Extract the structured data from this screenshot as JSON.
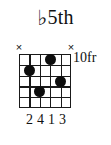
{
  "diagram": {
    "kind": "guitar-chord-diagram",
    "title": {
      "accidental": "♭",
      "text": "5th",
      "full": "♭5th"
    },
    "fret_position_label": "10fr",
    "grid": {
      "strings": 6,
      "frets": 5,
      "string_color": "#1a1a1a",
      "background": "#ffffff"
    },
    "string_markers": [
      {
        "string": 1,
        "symbol": "×",
        "meaning": "muted"
      },
      {
        "string": 2,
        "symbol": "",
        "meaning": "none"
      },
      {
        "string": 3,
        "symbol": "",
        "meaning": "none"
      },
      {
        "string": 4,
        "symbol": "",
        "meaning": "none"
      },
      {
        "string": 5,
        "symbol": "",
        "meaning": "none"
      },
      {
        "string": 6,
        "symbol": "×",
        "meaning": "muted"
      }
    ],
    "dots": [
      {
        "string": 2,
        "fret": 2,
        "color": "#0d0d0d"
      },
      {
        "string": 3,
        "fret": 4,
        "color": "#0d0d0d"
      },
      {
        "string": 4,
        "fret": 1,
        "color": "#0d0d0d"
      },
      {
        "string": 5,
        "fret": 3,
        "color": "#0d0d0d"
      }
    ],
    "fingering": [
      {
        "string": 1,
        "number": ""
      },
      {
        "string": 2,
        "number": "2"
      },
      {
        "string": 3,
        "number": "4"
      },
      {
        "string": 4,
        "number": "1"
      },
      {
        "string": 5,
        "number": "3"
      },
      {
        "string": 6,
        "number": ""
      }
    ],
    "fingering_text": "2 4 1 3"
  }
}
